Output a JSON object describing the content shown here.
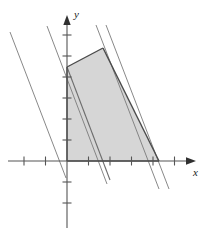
{
  "figure": {
    "kind": "linear-programming-feasible-region",
    "background_color": "#ffffff",
    "width": 215,
    "height": 232
  },
  "axes": {
    "x_axis": {
      "name": "x-axis",
      "label": "x",
      "color": "#555555",
      "arrow": true,
      "pixel_y": 161,
      "pixel_x_start": 8,
      "pixel_x_end": 196,
      "origin_pixel_x": 67,
      "tick_spacing_px": 21.5,
      "tick_length_px": 9,
      "ticks_pixel_x": [
        24,
        45.5,
        88.5,
        110,
        131.5,
        153,
        174.5
      ],
      "tick_values": [
        -2,
        -1,
        1,
        2,
        3,
        4,
        5
      ]
    },
    "y_axis": {
      "name": "y-axis",
      "label": "y",
      "color": "#555555",
      "arrow": true,
      "pixel_x": 67,
      "pixel_y_start": 17,
      "pixel_y_end": 228,
      "origin_pixel_y": 161,
      "tick_spacing_px": 21,
      "tick_length_px": 9,
      "ticks_pixel_y": [
        35,
        56,
        77,
        98,
        119,
        140,
        182,
        203
      ],
      "tick_values": [
        6,
        5,
        4,
        3,
        2,
        1,
        -1,
        -2
      ]
    }
  },
  "region": {
    "name": "feasible-region",
    "fill_color": "#d6d6d6",
    "edge_color": "#4a4a4a",
    "vertices_pixel": [
      {
        "x": 67,
        "y": 161
      },
      {
        "x": 67,
        "y": 67
      },
      {
        "x": 103,
        "y": 48
      },
      {
        "x": 159,
        "y": 161
      }
    ],
    "vertices_data": [
      {
        "x": 0,
        "y": 0
      },
      {
        "x": 0,
        "y": 4.48
      },
      {
        "x": 1.67,
        "y": 5.38
      },
      {
        "x": 4.28,
        "y": 0
      }
    ]
  },
  "objective_lines": {
    "name": "parallel-objective-lines",
    "color": "#7a7a7a",
    "slope_pixel": 2.62,
    "lines_pixel": [
      {
        "x1": 10,
        "y1": 32,
        "x2": 66,
        "y2": 178
      },
      {
        "x1": 47,
        "y1": 26,
        "x2": 107,
        "y2": 184
      },
      {
        "x1": 67,
        "y1": 67,
        "x2": 110,
        "y2": 180
      },
      {
        "x1": 96,
        "y1": 25,
        "x2": 159,
        "y2": 189
      },
      {
        "x1": 106,
        "y1": 25,
        "x2": 169,
        "y2": 189
      }
    ]
  },
  "chart_data": {
    "type": "line",
    "title": "",
    "xlabel": "x",
    "ylabel": "y",
    "xlim": [
      -2.75,
      6
    ],
    "ylim": [
      -3.2,
      6.9
    ],
    "grid": false,
    "legend": "none",
    "x_ticks": [
      -2,
      -1,
      1,
      2,
      3,
      4,
      5
    ],
    "y_ticks": [
      -2,
      -1,
      1,
      2,
      3,
      4,
      5,
      6
    ],
    "shaded_region": {
      "label": "feasible region",
      "polygon": [
        [
          0,
          0
        ],
        [
          0,
          4.48
        ],
        [
          1.67,
          5.38
        ],
        [
          4.28,
          0
        ]
      ],
      "fill": "#d6d6d6"
    },
    "series": [
      {
        "name": "objective line 1",
        "x": [
          -2.65,
          -0.05
        ],
        "y": [
          6.14,
          -0.81
        ]
      },
      {
        "name": "objective line 2",
        "x": [
          -0.93,
          1.86
        ],
        "y": [
          6.43,
          -1.1
        ]
      },
      {
        "name": "objective line 3",
        "x": [
          0,
          2.0
        ],
        "y": [
          4.48,
          -0.9
        ]
      },
      {
        "name": "objective line 4",
        "x": [
          1.35,
          4.28
        ],
        "y": [
          6.48,
          -1.33
        ]
      },
      {
        "name": "objective line 5",
        "x": [
          1.81,
          4.74
        ],
        "y": [
          6.48,
          -1.33
        ]
      }
    ],
    "annotations": []
  }
}
